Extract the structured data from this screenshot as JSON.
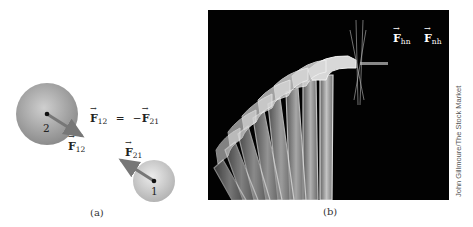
{
  "panel_a": {
    "caption": "(a)",
    "particle_2": {
      "label": "2",
      "force_label": "F",
      "force_sub": "12"
    },
    "particle_1": {
      "label": "1",
      "force_label": "F",
      "force_sub": "21"
    },
    "equation": {
      "lhs": "F",
      "lhs_sub": "12",
      "eq": "=",
      "rhs_sign": "−",
      "rhs": "F",
      "rhs_sub": "21"
    }
  },
  "panel_b": {
    "caption": "(b)",
    "force_hn": {
      "label": "F",
      "sub": "hn"
    },
    "force_nh": {
      "label": "F",
      "sub": "nh"
    },
    "credit": "John Gillmoure/The Stock Market"
  },
  "colors": {
    "sphere_light": "#d8d8d8",
    "sphere_dark": "#8a8a8a",
    "arrow": "#6e6e6e",
    "photo_bg": "#020202"
  }
}
